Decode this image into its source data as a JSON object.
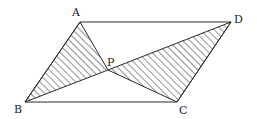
{
  "diagram": {
    "type": "geometry",
    "figure": "parallelogram ABCD with interior point P; triangles ABP and CDP shaded with hatching",
    "line_color": "#2a2a2a",
    "hatch_color": "#2a2a2a",
    "vertices": {
      "A": {
        "label": "A",
        "x": 80,
        "y": 22
      },
      "D": {
        "label": "D",
        "x": 231,
        "y": 22
      },
      "B": {
        "label": "B",
        "x": 25,
        "y": 102
      },
      "C": {
        "label": "C",
        "x": 177,
        "y": 102
      },
      "P": {
        "label": "P",
        "x": 108,
        "y": 70
      }
    },
    "edges": [
      "AD",
      "DC",
      "CB",
      "BA",
      "AP",
      "BP",
      "CP",
      "DP"
    ],
    "shaded_regions": [
      "triangle ABP",
      "triangle CDP"
    ]
  },
  "labels": {
    "A": "A",
    "B": "B",
    "C": "C",
    "D": "D",
    "P": "P"
  }
}
